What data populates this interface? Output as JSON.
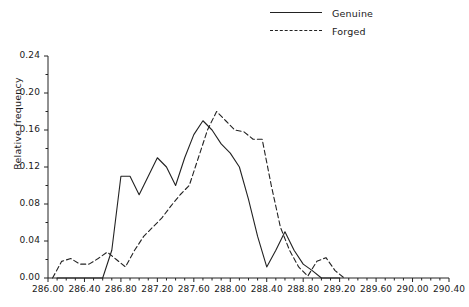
{
  "chart_data": {
    "type": "line",
    "title": "",
    "xlabel": "",
    "ylabel": "Relative frequency",
    "xlim": [
      286.0,
      290.4
    ],
    "ylim": [
      0.0,
      0.24
    ],
    "grid": false,
    "legend_position": "top-right",
    "xticks": [
      "286.00",
      "286.40",
      "286.80",
      "287.20",
      "287.60",
      "288.00",
      "288.40",
      "288.80",
      "289.20",
      "289.60",
      "290.00",
      "290.40"
    ],
    "xtick_values": [
      286.0,
      286.4,
      286.8,
      287.2,
      287.6,
      288.0,
      288.4,
      288.8,
      289.2,
      289.6,
      290.0,
      290.4
    ],
    "yticks": [
      "0.00",
      "0.04",
      "0.08",
      "0.12",
      "0.16",
      "0.20",
      "0.24"
    ],
    "ytick_values": [
      0.0,
      0.04,
      0.08,
      0.12,
      0.16,
      0.2,
      0.24
    ],
    "minor_xtick_step": 0.1,
    "series": [
      {
        "name": "Genuine",
        "style": "solid",
        "color": "#222222",
        "x": [
          286.1,
          286.2,
          286.3,
          286.4,
          286.5,
          286.6,
          286.7,
          286.8,
          286.9,
          287.0,
          287.1,
          287.2,
          287.3,
          287.4,
          287.5,
          287.6,
          287.7,
          287.8,
          287.9,
          288.0,
          288.1,
          288.2,
          288.3,
          288.4,
          288.5,
          288.6,
          288.7,
          288.8,
          288.9,
          289.0,
          289.1,
          289.2
        ],
        "y": [
          0.0,
          0.0,
          0.0,
          0.0,
          0.0,
          0.0,
          0.03,
          0.11,
          0.11,
          0.09,
          0.11,
          0.13,
          0.12,
          0.1,
          0.13,
          0.155,
          0.17,
          0.16,
          0.145,
          0.135,
          0.12,
          0.085,
          0.045,
          0.012,
          0.03,
          0.05,
          0.03,
          0.015,
          0.008,
          0.0,
          0.0,
          0.0
        ]
      },
      {
        "name": "Forged",
        "style": "dashed",
        "color": "#222222",
        "x": [
          286.05,
          286.15,
          286.25,
          286.35,
          286.45,
          286.55,
          286.65,
          286.75,
          286.85,
          286.95,
          287.05,
          287.15,
          287.25,
          287.35,
          287.45,
          287.55,
          287.65,
          287.75,
          287.85,
          287.95,
          288.05,
          288.15,
          288.25,
          288.35,
          288.45,
          288.55,
          288.65,
          288.75,
          288.85,
          288.95,
          289.05,
          289.15,
          289.25
        ],
        "y": [
          0.0,
          0.018,
          0.021,
          0.015,
          0.015,
          0.021,
          0.028,
          0.02,
          0.012,
          0.03,
          0.045,
          0.055,
          0.065,
          0.078,
          0.09,
          0.1,
          0.13,
          0.16,
          0.18,
          0.17,
          0.16,
          0.158,
          0.15,
          0.15,
          0.1,
          0.055,
          0.03,
          0.012,
          0.002,
          0.018,
          0.022,
          0.008,
          0.0
        ]
      }
    ]
  },
  "legend": {
    "items": [
      {
        "label": "Genuine",
        "style": "solid"
      },
      {
        "label": "Forged",
        "style": "dashed"
      }
    ]
  },
  "caption": {
    "text": ""
  }
}
